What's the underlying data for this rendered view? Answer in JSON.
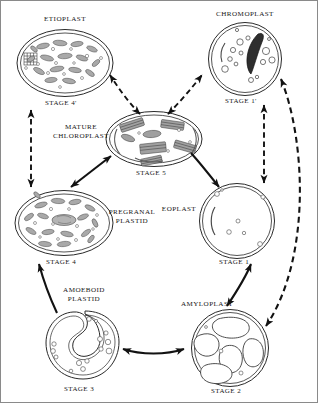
{
  "diagram": {
    "background_color": "#ffffff",
    "line_color": "#1a1a1a",
    "fill_gray": "#9a9a9a",
    "organelles": [
      {
        "id": "etioplast",
        "name": "ETIOPLAST",
        "stage": "STAGE 4'",
        "shape": "oval",
        "cx": 64,
        "cy": 62,
        "rx": 49,
        "ry": 34,
        "name_x": 64,
        "name_y": 18,
        "stage_x": 64,
        "stage_y": 102,
        "feature": "prolamellar-body-grid-and-vesicles"
      },
      {
        "id": "chromoplast",
        "name": "CHROMOPLAST",
        "stage": "STAGE 1'",
        "shape": "circle",
        "cx": 244,
        "cy": 58,
        "rx": 37,
        "ry": 37,
        "name_x": 244,
        "name_y": 13,
        "stage_x": 244,
        "stage_y": 100,
        "feature": "dark-carotenoid-crystal-and-globules"
      },
      {
        "id": "mature-chloroplast",
        "name": "MATURE CHLOROPLAST",
        "stage": "STAGE 5",
        "shape": "oval",
        "cx": 153,
        "cy": 138,
        "rx": 49,
        "ry": 28,
        "name_x": 78,
        "name_y": 132,
        "stage_x": 153,
        "stage_y": 172,
        "feature": "grana-stacks"
      },
      {
        "id": "pregranal-plastid",
        "name": "PREGRANAL PLASTID",
        "stage": "STAGE 4",
        "shape": "oval",
        "cx": 63,
        "cy": 222,
        "rx": 50,
        "ry": 33,
        "name_x": 128,
        "name_y": 216,
        "stage_x": 63,
        "stage_y": 261,
        "feature": "many-vesicles-central-nucleoid"
      },
      {
        "id": "eoplast",
        "name": "EOPLAST",
        "stage": "STAGE 1",
        "shape": "circle",
        "cx": 236,
        "cy": 220,
        "rx": 38,
        "ry": 38,
        "name_x": 178,
        "name_y": 208,
        "stage_x": 236,
        "stage_y": 261,
        "feature": "few-small-vesicles-and-invagination"
      },
      {
        "id": "amoeboid-plastid",
        "name": "AMOEBOID PLASTID",
        "stage": "STAGE 3",
        "shape": "amoeboid",
        "cx": 81,
        "cy": 345,
        "rx": 35,
        "ry": 35,
        "name_x": 82,
        "name_y": 292,
        "stage_x": 81,
        "stage_y": 388,
        "feature": "deep-cleft-lobed-form"
      },
      {
        "id": "amyloplast",
        "name": "AMYLOPLAST",
        "stage": "STAGE 2",
        "shape": "circle",
        "cx": 229,
        "cy": 347,
        "rx": 39,
        "ry": 39,
        "name_x": 206,
        "name_y": 303,
        "stage_x": 229,
        "stage_y": 390,
        "feature": "large-starch-grains"
      }
    ],
    "arrows": [
      {
        "id": "stage5-etioplast",
        "from": "mature-chloroplast",
        "to": "etioplast",
        "style": "dashed",
        "heads": "both"
      },
      {
        "id": "stage5-chromoplast",
        "from": "mature-chloroplast",
        "to": "chromoplast",
        "style": "dashed",
        "heads": "both"
      },
      {
        "id": "etioplast-pregranal",
        "from": "etioplast",
        "to": "pregranal-plastid",
        "style": "dashed",
        "heads": "both"
      },
      {
        "id": "chromoplast-eoplast",
        "from": "chromoplast",
        "to": "eoplast",
        "style": "dashed",
        "heads": "both"
      },
      {
        "id": "chromoplast-amyloplast",
        "from": "chromoplast",
        "to": "amyloplast",
        "style": "dashed",
        "heads": "both"
      },
      {
        "id": "pregranal-stage5",
        "from": "pregranal-plastid",
        "to": "mature-chloroplast",
        "style": "solid",
        "heads": "both"
      },
      {
        "id": "stage5-eoplast",
        "from": "mature-chloroplast",
        "to": "eoplast",
        "style": "solid",
        "heads": "single"
      },
      {
        "id": "amoeboid-pregranal",
        "from": "amoeboid-plastid",
        "to": "pregranal-plastid",
        "style": "solid",
        "heads": "single"
      },
      {
        "id": "amoeboid-amyloplast",
        "from": "amoeboid-plastid",
        "to": "amyloplast",
        "style": "solid",
        "heads": "both"
      },
      {
        "id": "amyloplast-eoplast",
        "from": "amyloplast",
        "to": "eoplast",
        "style": "solid",
        "heads": "both"
      }
    ]
  }
}
